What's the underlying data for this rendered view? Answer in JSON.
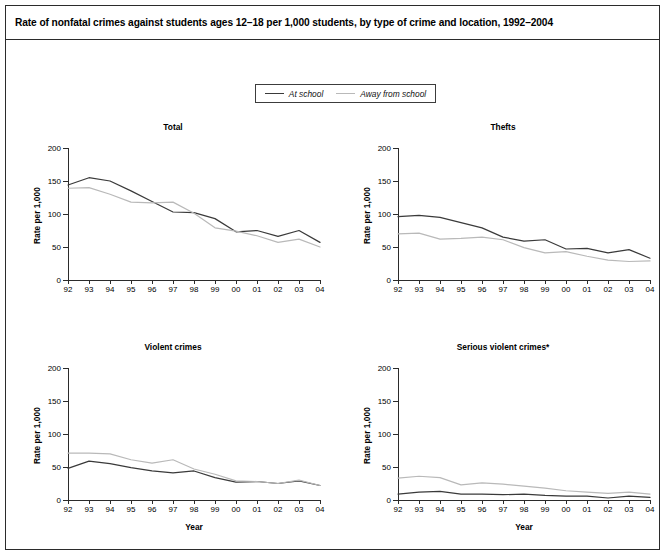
{
  "figure": {
    "title": "Rate of nonfatal crimes against students ages 12–18 per 1,000 students, by type of crime and location, 1992–2004"
  },
  "legend": {
    "entries": [
      {
        "label": "At school",
        "color": "#3a3a3a"
      },
      {
        "label": "Away from school",
        "color": "#b9b9b9"
      }
    ]
  },
  "axes": {
    "ylabel": "Rate per 1,000",
    "xlabel": "Year",
    "yticks": [
      "0",
      "50",
      "100",
      "150",
      "200"
    ],
    "xticks": [
      "92",
      "93",
      "94",
      "95",
      "96",
      "97",
      "98",
      "99",
      "00",
      "01",
      "02",
      "03",
      "04"
    ]
  },
  "chart_data": [
    {
      "type": "line",
      "title": "Total",
      "xlabel": "Year",
      "ylabel": "Rate per 1,000",
      "xlim": [
        1992,
        2004
      ],
      "ylim": [
        0,
        200
      ],
      "yticks": [
        0,
        50,
        100,
        150,
        200
      ],
      "grid": false,
      "legend_position": "above-figure",
      "x": [
        1992,
        1993,
        1994,
        1995,
        1996,
        1997,
        1998,
        1999,
        2000,
        2001,
        2002,
        2003,
        2004
      ],
      "categories": [
        "92",
        "93",
        "94",
        "95",
        "96",
        "97",
        "98",
        "99",
        "00",
        "01",
        "02",
        "03",
        "04"
      ],
      "series": [
        {
          "name": "At school",
          "color": "#3a3a3a",
          "values": [
            144,
            155,
            150,
            135,
            119,
            103,
            102,
            93,
            73,
            75,
            66,
            75,
            57
          ]
        },
        {
          "name": "Away from school",
          "color": "#b9b9b9",
          "values": [
            139,
            140,
            130,
            118,
            117,
            118,
            101,
            79,
            74,
            67,
            57,
            62,
            50
          ]
        }
      ]
    },
    {
      "type": "line",
      "title": "Thefts",
      "xlabel": "Year",
      "ylabel": "Rate per 1,000",
      "xlim": [
        1992,
        2004
      ],
      "ylim": [
        0,
        200
      ],
      "yticks": [
        0,
        50,
        100,
        150,
        200
      ],
      "grid": false,
      "x": [
        1992,
        1993,
        1994,
        1995,
        1996,
        1997,
        1998,
        1999,
        2000,
        2001,
        2002,
        2003,
        2004
      ],
      "categories": [
        "92",
        "93",
        "94",
        "95",
        "96",
        "97",
        "98",
        "99",
        "00",
        "01",
        "02",
        "03",
        "04"
      ],
      "series": [
        {
          "name": "At school",
          "color": "#3a3a3a",
          "values": [
            96,
            98,
            95,
            87,
            79,
            65,
            59,
            61,
            47,
            48,
            41,
            46,
            33
          ]
        },
        {
          "name": "Away from school",
          "color": "#b9b9b9",
          "values": [
            70,
            71,
            62,
            63,
            65,
            61,
            49,
            41,
            43,
            36,
            30,
            28,
            29
          ]
        }
      ]
    },
    {
      "type": "line",
      "title": "Violent crimes",
      "xlabel": "Year",
      "ylabel": "Rate per 1,000",
      "xlim": [
        1992,
        2004
      ],
      "ylim": [
        0,
        200
      ],
      "yticks": [
        0,
        50,
        100,
        150,
        200
      ],
      "grid": false,
      "x": [
        1992,
        1993,
        1994,
        1995,
        1996,
        1997,
        1998,
        1999,
        2000,
        2001,
        2002,
        2003,
        2004
      ],
      "categories": [
        "92",
        "93",
        "94",
        "95",
        "96",
        "97",
        "98",
        "99",
        "00",
        "01",
        "02",
        "03",
        "04"
      ],
      "series": [
        {
          "name": "At school",
          "color": "#3a3a3a",
          "values": [
            48,
            59,
            55,
            49,
            44,
            41,
            44,
            34,
            27,
            28,
            25,
            29,
            22
          ]
        },
        {
          "name": "Away from school",
          "color": "#b9b9b9",
          "values": [
            71,
            71,
            70,
            61,
            56,
            61,
            47,
            39,
            29,
            28,
            25,
            30,
            22
          ]
        }
      ]
    },
    {
      "type": "line",
      "title": "Serious violent crimes*",
      "xlabel": "Year",
      "ylabel": "Rate per 1,000",
      "xlim": [
        1992,
        2004
      ],
      "ylim": [
        0,
        200
      ],
      "yticks": [
        0,
        50,
        100,
        150,
        200
      ],
      "grid": false,
      "x": [
        1992,
        1993,
        1994,
        1995,
        1996,
        1997,
        1998,
        1999,
        2000,
        2001,
        2002,
        2003,
        2004
      ],
      "categories": [
        "92",
        "93",
        "94",
        "95",
        "96",
        "97",
        "98",
        "99",
        "00",
        "01",
        "02",
        "03",
        "04"
      ],
      "series": [
        {
          "name": "At school",
          "color": "#3a3a3a",
          "values": [
            9,
            12,
            13,
            9,
            9,
            8,
            9,
            7,
            6,
            6,
            3,
            6,
            4
          ]
        },
        {
          "name": "Away from school",
          "color": "#b9b9b9",
          "values": [
            33,
            36,
            34,
            23,
            26,
            24,
            21,
            18,
            14,
            12,
            10,
            12,
            9
          ]
        }
      ]
    }
  ],
  "panel_layout": [
    {
      "left": 20,
      "top": 116
    },
    {
      "left": 350,
      "top": 116
    },
    {
      "left": 20,
      "top": 336
    },
    {
      "left": 350,
      "top": 336
    }
  ]
}
